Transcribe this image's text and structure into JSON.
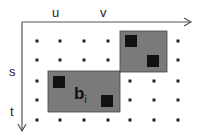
{
  "labels": {
    "u": "u",
    "v": "v",
    "s": "s",
    "t": "t",
    "block": "b",
    "block_sub": "i"
  },
  "colors": {
    "rect": "#7a7a7a",
    "square": "#111111",
    "dot": "#222222",
    "axis": "#555555"
  },
  "dots": {
    "cols": [
      37,
      60,
      84,
      108,
      130,
      154,
      178
    ],
    "rows": [
      41,
      60,
      81,
      100,
      120
    ]
  },
  "rects": [
    {
      "x": 48,
      "y": 71,
      "w": 72,
      "h": 41
    },
    {
      "x": 120,
      "y": 31,
      "w": 47,
      "h": 41
    }
  ],
  "squares": [
    {
      "x": 53,
      "y": 76,
      "s": 12
    },
    {
      "x": 101,
      "y": 95,
      "s": 12
    },
    {
      "x": 125,
      "y": 35,
      "s": 12
    },
    {
      "x": 147,
      "y": 55,
      "s": 12
    }
  ]
}
